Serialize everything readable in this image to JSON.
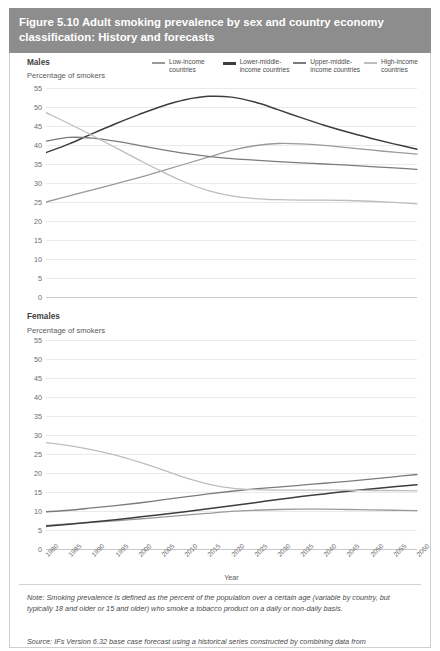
{
  "figure": {
    "title": "Figure 5.10 Adult smoking prevalence by sex and country economy classification: History and forecasts",
    "header_color": "#8d8d8d",
    "note": "Note: Smoking prevalence is defined as the percent of the population over a certain age (variable by country, but typically 18 and older or 15 and older) who smoke a tobacco product on a daily or non-daily basis.",
    "source": "Source: IFs Version 6.32 base case forecast using a historical series constructed by combining data from"
  },
  "legend": {
    "items": [
      {
        "label": "Low-income countries",
        "color": "#9a9a9a"
      },
      {
        "label": "Lower-middle-income countries",
        "color": "#3d3d3d"
      },
      {
        "label": "Upper-middle-income countries",
        "color": "#7b7b7b"
      },
      {
        "label": "High-income countries",
        "color": "#bdbdbd"
      }
    ]
  },
  "panels": {
    "males": {
      "label": "Males",
      "ylabel": "Percentage of smokers"
    },
    "females": {
      "label": "Females",
      "ylabel": "Percentage of smokers"
    }
  },
  "axes": {
    "xlabel": "Year",
    "yticks": [
      55,
      50,
      45,
      40,
      35,
      30,
      25,
      20,
      15,
      10,
      5,
      0
    ],
    "xticks": [
      1980,
      1985,
      1990,
      1995,
      2000,
      2005,
      2010,
      2015,
      2020,
      2025,
      2030,
      2035,
      2040,
      2045,
      2050,
      2055,
      2060
    ]
  },
  "chart_data": [
    {
      "type": "line",
      "title": "Males",
      "xlabel": "Year",
      "ylabel": "Percentage of smokers",
      "xlim": [
        1980,
        2060
      ],
      "ylim": [
        0,
        55
      ],
      "grid": true,
      "legend_position": "top",
      "x": [
        1980,
        1985,
        1990,
        1995,
        2000,
        2005,
        2010,
        2015,
        2020,
        2025,
        2030,
        2035,
        2040,
        2045,
        2050,
        2055,
        2060
      ],
      "series": [
        {
          "name": "Low-income countries",
          "color": "#9a9a9a",
          "values": [
            25.0,
            26.6,
            28.2,
            29.8,
            31.4,
            33.2,
            35.0,
            36.8,
            38.6,
            39.8,
            40.4,
            40.3,
            39.9,
            39.3,
            38.7,
            38.1,
            37.6
          ]
        },
        {
          "name": "Lower-middle-income countries",
          "color": "#3d3d3d",
          "values": [
            38.0,
            40.3,
            43.0,
            45.6,
            48.0,
            50.2,
            51.9,
            52.8,
            52.6,
            51.3,
            49.3,
            47.2,
            45.2,
            43.4,
            41.8,
            40.3,
            38.9
          ]
        },
        {
          "name": "Upper-middle-income countries",
          "color": "#7b7b7b",
          "values": [
            41.0,
            42.0,
            41.8,
            41.0,
            39.9,
            38.8,
            37.8,
            37.0,
            36.4,
            36.0,
            35.6,
            35.3,
            35.0,
            34.7,
            34.3,
            34.0,
            33.6
          ]
        },
        {
          "name": "High-income countries",
          "color": "#bdbdbd",
          "values": [
            48.5,
            45.6,
            42.5,
            39.3,
            36.1,
            33.0,
            30.2,
            28.0,
            26.6,
            25.9,
            25.6,
            25.5,
            25.5,
            25.4,
            25.2,
            24.9,
            24.5
          ]
        }
      ]
    },
    {
      "type": "line",
      "title": "Females",
      "xlabel": "Year",
      "ylabel": "Percentage of smokers",
      "xlim": [
        1980,
        2060
      ],
      "ylim": [
        0,
        55
      ],
      "grid": true,
      "legend_position": "top",
      "x": [
        1980,
        1985,
        1990,
        1995,
        2000,
        2005,
        2010,
        2015,
        2020,
        2025,
        2030,
        2035,
        2040,
        2045,
        2050,
        2055,
        2060
      ],
      "series": [
        {
          "name": "Low-income countries",
          "color": "#9a9a9a",
          "values": [
            6.2,
            6.6,
            7.0,
            7.4,
            7.9,
            8.4,
            8.9,
            9.4,
            9.9,
            10.2,
            10.4,
            10.5,
            10.5,
            10.4,
            10.3,
            10.2,
            10.1
          ]
        },
        {
          "name": "Lower-middle-income countries",
          "color": "#3d3d3d",
          "values": [
            6.0,
            6.5,
            7.1,
            7.7,
            8.4,
            9.1,
            9.8,
            10.6,
            11.4,
            12.2,
            13.0,
            13.8,
            14.5,
            15.2,
            15.8,
            16.4,
            16.9
          ]
        },
        {
          "name": "Upper-middle-income countries",
          "color": "#7b7b7b",
          "values": [
            9.8,
            10.2,
            10.8,
            11.4,
            12.1,
            12.9,
            13.7,
            14.5,
            15.2,
            15.8,
            16.3,
            16.8,
            17.3,
            17.8,
            18.4,
            19.0,
            19.6
          ]
        },
        {
          "name": "High-income countries",
          "color": "#bdbdbd",
          "values": [
            28.0,
            27.2,
            26.1,
            24.7,
            22.9,
            20.9,
            18.8,
            17.1,
            16.0,
            15.6,
            15.5,
            15.5,
            15.5,
            15.5,
            15.4,
            15.4,
            15.3
          ]
        }
      ]
    }
  ]
}
